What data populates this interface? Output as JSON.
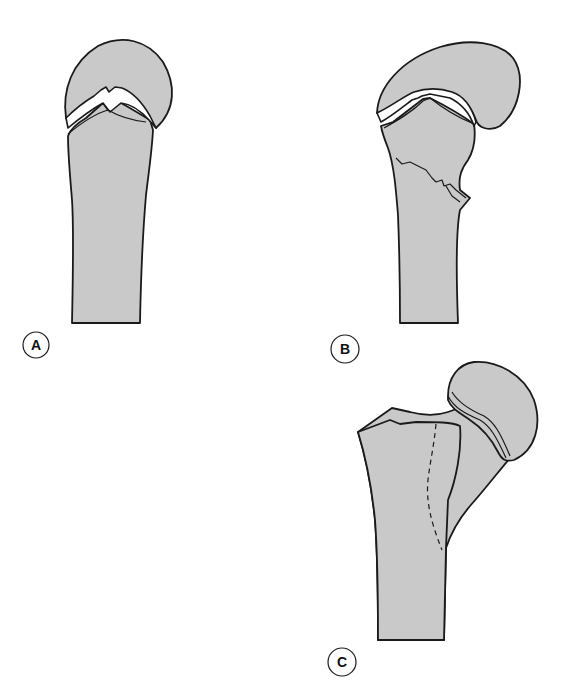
{
  "figure": {
    "type": "medical-illustration",
    "fill_color": "#c9c9c9",
    "stroke_color": "#1a1a1a",
    "background": "#ffffff"
  },
  "panels": [
    {
      "id": "A",
      "label": "A",
      "description": "Epiphysis separated from metaphysis through the growth plate; shaft straight"
    },
    {
      "id": "B",
      "label": "B",
      "description": "Epiphyseal separation with metaphyseal fracture fragment (jagged fracture line)"
    },
    {
      "id": "C",
      "label": "C",
      "description": "Proximal femur with head and neck; dashed line indicating fracture path"
    }
  ]
}
